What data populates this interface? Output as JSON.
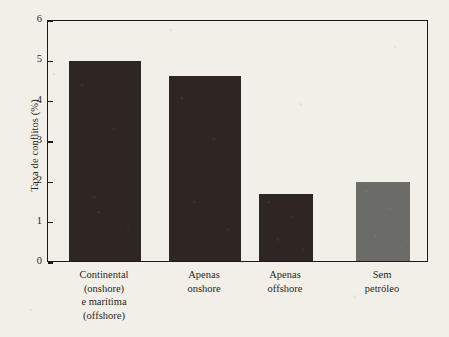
{
  "chart_data": {
    "type": "bar",
    "title": "",
    "subtitle": "",
    "xlabel": "",
    "ylabel": "Taxa de conflitos (%)",
    "categories": [
      "Continental (onshore) e marítima (offshore)",
      "Apenas onshore",
      "Apenas offshore",
      "Sem petróleo"
    ],
    "category_lines": [
      [
        "Continental",
        "(onshore)",
        "e marítima",
        "(offshore)"
      ],
      [
        "Apenas",
        "onshore"
      ],
      [
        "Apenas",
        "offshore"
      ],
      [
        "Sem",
        "petróleo"
      ]
    ],
    "values": [
      4.95,
      4.58,
      1.65,
      1.97
    ],
    "bar_colors": [
      "#2e2622",
      "#2e2622",
      "#2e2622",
      "#6b6b68"
    ],
    "ylim": [
      0,
      6
    ],
    "ytick_labels": [
      "0",
      "1",
      "2",
      "3",
      "4",
      "5",
      "6"
    ],
    "ytick_values": [
      0,
      1,
      2,
      3,
      4,
      5,
      6
    ],
    "grid": false,
    "legend": null,
    "annotations": []
  },
  "figure": {
    "background_color": "#f2efe8",
    "frame_color": "#1d1a16",
    "text_color": "#2b2723"
  }
}
